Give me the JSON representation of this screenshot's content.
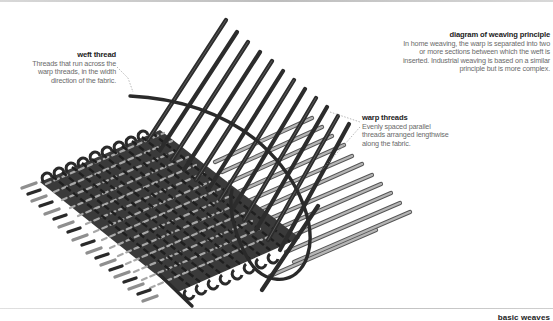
{
  "diagram": {
    "title": "diagram of weaving principle",
    "description": "In home weaving, the warp is separated into two or more sections between which the weft is inserted. Industrial weaving is based on a similar principle but is more complex.",
    "labels": {
      "weft": {
        "title": "weft thread",
        "description": "Threads that run across the warp threads, in the width direction of the fabric."
      },
      "warp": {
        "title": "warp threads",
        "description": "Evenly spaced parallel threads arranged lengthwise along the fabric."
      }
    },
    "colors": {
      "warp_thread": "#2e2e2e",
      "weft_thread": "#9a9a9a",
      "leader_line": "#9a9a9a"
    }
  },
  "footer": {
    "section_title": "basic weaves"
  }
}
